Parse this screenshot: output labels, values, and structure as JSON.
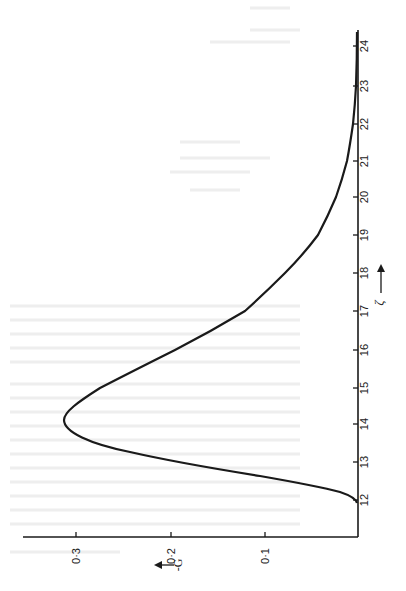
{
  "chart_data": {
    "type": "line",
    "orientation": "rotated-90",
    "title": "",
    "xlabel": "ζ",
    "ylabel": "-G",
    "xlim": [
      12,
      24.4
    ],
    "ylim": [
      0,
      0.3
    ],
    "x_ticks": [
      "12",
      "13",
      "14",
      "15",
      "16",
      "17",
      "18",
      "19",
      "20",
      "21",
      "22",
      "23",
      "24"
    ],
    "y_ticks": [
      "0·1",
      "0·2",
      "0·3"
    ],
    "grid": false,
    "legend": null,
    "series": [
      {
        "name": "-G",
        "x": [
          12.05,
          12.5,
          13.0,
          13.5,
          14.0,
          14.2,
          14.5,
          15.0,
          16.0,
          17.0,
          18.0,
          19.0,
          20.0,
          21.0,
          22.0,
          23.0,
          24.4
        ],
        "values": [
          0.002,
          0.06,
          0.205,
          0.285,
          0.308,
          0.31,
          0.302,
          0.275,
          0.195,
          0.12,
          0.078,
          0.043,
          0.023,
          0.012,
          0.005,
          0.002,
          0.001
        ]
      }
    ]
  },
  "axes": {
    "zeta_label": "ζ",
    "g_label": "-G",
    "zeta_ticks": [
      {
        "label": "12",
        "y": 500
      },
      {
        "label": "13",
        "y": 462
      },
      {
        "label": "14",
        "y": 424
      },
      {
        "label": "15",
        "y": 388
      },
      {
        "label": "16",
        "y": 350
      },
      {
        "label": "17",
        "y": 311
      },
      {
        "label": "18",
        "y": 273
      },
      {
        "label": "19",
        "y": 235
      },
      {
        "label": "20",
        "y": 197
      },
      {
        "label": "21",
        "y": 161
      },
      {
        "label": "22",
        "y": 124
      },
      {
        "label": "23",
        "y": 86
      },
      {
        "label": "24",
        "y": 46
      }
    ],
    "g_ticks": [
      {
        "label": "0·1",
        "x": 265
      },
      {
        "label": "0·2",
        "x": 171
      },
      {
        "label": "0·3",
        "x": 76
      }
    ]
  }
}
